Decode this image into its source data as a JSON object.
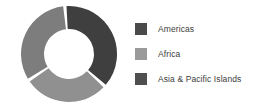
{
  "chart_data": {
    "type": "pie",
    "variant": "donut",
    "title": "",
    "subtitle": "",
    "xlabel": "",
    "ylabel": "",
    "grid": false,
    "legend_position": "right",
    "inner_radius_ratio": 0.52,
    "start_angle_deg": -3,
    "direction": "clockwise",
    "categories": [
      "Americas",
      "Africa",
      "Asia & Pacific Islands"
    ],
    "values": [
      37,
      28,
      35
    ],
    "labels_shown_on_slices": false,
    "slices": [
      {
        "name": "Americas",
        "value": 37,
        "color": "#3f3f3f",
        "start_angle_deg": 357,
        "end_angle_deg": 490
      },
      {
        "name": "Africa",
        "value": 28,
        "color": "#909090",
        "start_angle_deg": 494,
        "end_angle_deg": 595
      },
      {
        "name": "Asia & Pacific Islands",
        "value": 35,
        "color": "#7d7d7d",
        "start_angle_deg": 599,
        "end_angle_deg": 713
      }
    ]
  },
  "legend": {
    "items": [
      {
        "label": "Americas",
        "swatch_color": "#4a4a4a",
        "swatch_icon": "legend-color-swatch"
      },
      {
        "label": "Africa",
        "swatch_color": "#9a9a9a",
        "swatch_icon": "legend-color-swatch"
      },
      {
        "label": "Asia & Pacific Islands",
        "swatch_color": "#4f4f4f",
        "swatch_icon": "legend-color-swatch"
      }
    ]
  },
  "colors": {
    "background": "#ffffff",
    "text": "#3d3d3d",
    "slice_americas": "#3f3f3f",
    "slice_africa": "#909090",
    "slice_asia_pacific": "#7d7d7d",
    "slice_gap": "#ffffff"
  }
}
